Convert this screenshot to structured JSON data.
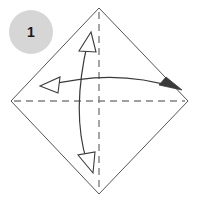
{
  "figure": {
    "background_color": "#ffffff",
    "width": 197,
    "height": 202
  },
  "step_badge": {
    "name": "step-number-badge",
    "label": "1",
    "fill_color": "#d6d6d6",
    "text_color": "#1a1a1a",
    "center_x": 31,
    "center_y": 32,
    "radius": 22
  },
  "paper": {
    "name": "square-paper-diamond",
    "shape": "diamond",
    "stroke_color": "#555555",
    "fill_color": "#ffffff",
    "stroke_width": 1,
    "points": {
      "top": {
        "x": 99,
        "y": 8
      },
      "right": {
        "x": 188,
        "y": 101
      },
      "bottom": {
        "x": 99,
        "y": 194
      },
      "left": {
        "x": 11,
        "y": 101
      }
    }
  },
  "crease_lines": [
    {
      "name": "horizontal-crease",
      "style": "dashed",
      "stroke_color": "#808080",
      "dash": "7 5",
      "x1": 14,
      "y1": 101,
      "x2": 185,
      "y2": 101
    },
    {
      "name": "vertical-crease",
      "style": "dashed",
      "stroke_color": "#808080",
      "dash": "7 5",
      "x1": 99,
      "y1": 12,
      "x2": 99,
      "y2": 190
    }
  ],
  "arrows": [
    {
      "name": "horizontal-fold-arrow",
      "description": "double headed curved arrow spanning left to right, arcing upward",
      "stroke_color": "#3a3a3a",
      "path": "M 46 86 Q 115 68 176 88",
      "head_start": {
        "name": "arrowhead-left-hollow",
        "style": "hollow",
        "points": "40 86 60 77 58 93"
      },
      "head_end": {
        "name": "arrowhead-right-solid",
        "style": "solid",
        "points": "181 90 160 86 166 78"
      }
    },
    {
      "name": "vertical-fold-arrow",
      "description": "double headed curved arrow spanning top to bottom, bulging left",
      "stroke_color": "#3a3a3a",
      "path": "M 88 41 Q 72 115 87 163",
      "head_start": {
        "name": "arrowhead-top-hollow",
        "style": "hollow",
        "points": "90 33 80 52 96 51"
      },
      "head_end": {
        "name": "arrowhead-bottom-hollow",
        "style": "hollow",
        "points": "92 172 80 154 96 153"
      }
    }
  ]
}
